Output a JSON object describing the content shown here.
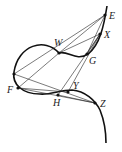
{
  "diagram": {
    "type": "geometry-curve-with-chords",
    "points": [
      {
        "id": "E",
        "label": "E",
        "x": 105,
        "y": 15,
        "lx": 109,
        "ly": 19
      },
      {
        "id": "X",
        "label": "X",
        "x": 100,
        "y": 34,
        "lx": 104,
        "ly": 38
      },
      {
        "id": "W",
        "label": "W",
        "x": 59,
        "y": 53,
        "lx": 54,
        "ly": 46
      },
      {
        "id": "G",
        "label": "G",
        "x": 87,
        "y": 54,
        "lx": 89,
        "ly": 64
      },
      {
        "id": "P",
        "label": "",
        "x": 14,
        "y": 74,
        "lx": 0,
        "ly": 0
      },
      {
        "id": "F",
        "label": "F",
        "x": 18,
        "y": 88,
        "lx": 7,
        "ly": 93
      },
      {
        "id": "H",
        "label": "H",
        "x": 58,
        "y": 95,
        "lx": 53,
        "ly": 106
      },
      {
        "id": "Y",
        "label": "Y",
        "x": 68,
        "y": 92,
        "lx": 73,
        "ly": 89
      },
      {
        "id": "Z",
        "label": "Z",
        "x": 95,
        "y": 103,
        "lx": 100,
        "ly": 107
      }
    ],
    "chords": [
      [
        "E",
        "W"
      ],
      [
        "E",
        "P"
      ],
      [
        "E",
        "G"
      ],
      [
        "X",
        "W"
      ],
      [
        "X",
        "G"
      ],
      [
        "W",
        "F"
      ],
      [
        "F",
        "Y"
      ],
      [
        "F",
        "Z"
      ],
      [
        "P",
        "Z"
      ],
      [
        "H",
        "X"
      ],
      [
        "Y",
        "X"
      ],
      [
        "H",
        "Z"
      ]
    ]
  }
}
